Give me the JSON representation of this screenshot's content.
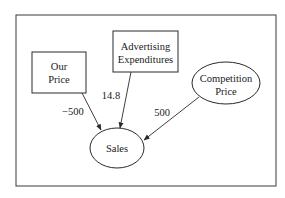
{
  "diagram": {
    "type": "influence-diagram",
    "nodes": {
      "our_price": {
        "line1": "Our",
        "line2": "Price",
        "shape": "rectangle"
      },
      "advertising": {
        "line1": "Advertising",
        "line2": "Expenditures",
        "shape": "rectangle"
      },
      "competition": {
        "line1": "Competition",
        "line2": "Price",
        "shape": "ellipse"
      },
      "sales": {
        "label": "Sales",
        "shape": "ellipse"
      }
    },
    "edges": [
      {
        "from": "Our Price",
        "to": "Sales",
        "label": "−500"
      },
      {
        "from": "Advertising Expenditures",
        "to": "Sales",
        "label": "14.8"
      },
      {
        "from": "Competition Price",
        "to": "Sales",
        "label": "500"
      }
    ],
    "colors": {
      "line": "#2a2a2a",
      "text": "#1a1a1a",
      "background": "#ffffff"
    }
  }
}
